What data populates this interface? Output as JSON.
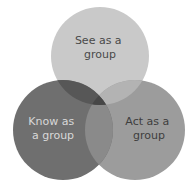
{
  "diagram": {
    "type": "venn",
    "sets": [
      {
        "id": "see",
        "label_lines": [
          "See as a",
          "group"
        ],
        "color": "#c9c9c9",
        "text_color": "#4a4a4a"
      },
      {
        "id": "know",
        "label_lines": [
          "Know as",
          "a group"
        ],
        "color": "#6f6f6f",
        "text_color": "#d8d8d8"
      },
      {
        "id": "act",
        "label_lines": [
          "Act as a",
          "group"
        ],
        "color": "#9c9c9c",
        "text_color": "#3e3e3e"
      }
    ],
    "overlap_colors": {
      "see_know": "#575757",
      "see_act": "#b3b3b3",
      "know_act": "#8a8a8a",
      "all": "#474747"
    }
  }
}
